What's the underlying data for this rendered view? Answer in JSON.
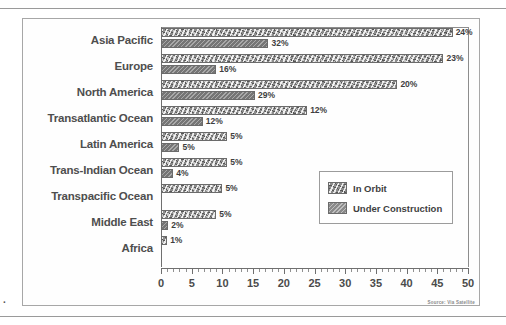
{
  "figure": {
    "source_note": "Source: Via Satellite",
    "margin_mark": "."
  },
  "legend": {
    "items": [
      {
        "key": "orbit",
        "label": "In Orbit"
      },
      {
        "key": "construction",
        "label": "Under Construction"
      }
    ]
  },
  "axis": {
    "ticks": [
      "0",
      "5",
      "10",
      "15",
      "20",
      "25",
      "30",
      "35",
      "40",
      "45",
      "50"
    ]
  },
  "chart_data": {
    "type": "bar",
    "orientation": "horizontal",
    "title": "",
    "xlabel": "",
    "ylabel": "",
    "xlim": [
      0,
      50
    ],
    "xticks": [
      0,
      5,
      10,
      15,
      20,
      25,
      30,
      35,
      40,
      45,
      50
    ],
    "minor_tick_step": 1,
    "grid": false,
    "legend_position": "inside-right",
    "categories": [
      "Asia Pacific",
      "Europe",
      "North America",
      "Transatlantic Ocean",
      "Latin America",
      "Trans-Indian Ocean",
      "Transpacific Ocean",
      "Middle East",
      "Africa"
    ],
    "series": [
      {
        "name": "In Orbit",
        "values": [
          47.5,
          46.0,
          38.5,
          23.8,
          10.8,
          10.8,
          10.0,
          9.0,
          1.0
        ],
        "labels": [
          "24%",
          "23%",
          "20%",
          "12%",
          "5%",
          "5%",
          "5%",
          "5%",
          "1%"
        ]
      },
      {
        "name": "Under Construction",
        "values": [
          17.5,
          9.0,
          15.3,
          6.8,
          3.0,
          2.0,
          null,
          1.2,
          null
        ],
        "labels": [
          "32%",
          "16%",
          "29%",
          "12%",
          "5%",
          "4%",
          "",
          "2%",
          ""
        ]
      }
    ]
  }
}
